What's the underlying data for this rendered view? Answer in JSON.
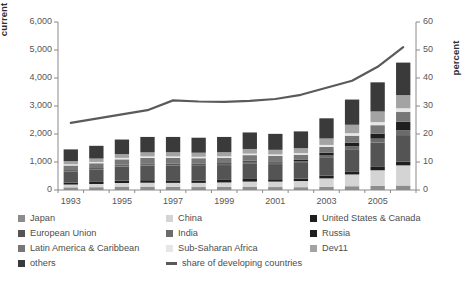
{
  "chart_data": {
    "type": "bar",
    "title": "",
    "subtitle": "",
    "stacked": true,
    "grid": false,
    "legend_position": "bottom",
    "xlabel": "",
    "ylabel": "current US$ (billions)",
    "y2label": "percent",
    "ylim": [
      0,
      6000
    ],
    "y2lim": [
      0,
      60
    ],
    "ytick_labels": [
      "6,000",
      "5,000",
      "4,000",
      "3,000",
      "2,000",
      "1,000",
      "0"
    ],
    "ytick_values": [
      6000,
      5000,
      4000,
      3000,
      2000,
      1000,
      0
    ],
    "y2tick_labels": [
      "60",
      "50",
      "40",
      "30",
      "20",
      "10",
      "0"
    ],
    "y2tick_values": [
      60,
      50,
      40,
      30,
      20,
      10,
      0
    ],
    "categories": [
      "1993",
      "1994",
      "1995",
      "1996",
      "1997",
      "1998",
      "1999",
      "2000",
      "2001",
      "2002",
      "2003",
      "2004",
      "2005",
      "2006"
    ],
    "xtick_labels": [
      "1993",
      "1995",
      "1997",
      "1999",
      "2001",
      "2003",
      "2005"
    ],
    "xtick_indices": [
      0,
      2,
      4,
      6,
      8,
      10,
      12
    ],
    "series": [
      {
        "name": "Japan",
        "color": "#8c8c8c",
        "values": [
          95,
          100,
          120,
          120,
          110,
          105,
          110,
          120,
          105,
          100,
          115,
          135,
          145,
          160
        ]
      },
      {
        "name": "China",
        "color": "#d4d4d4",
        "values": [
          100,
          115,
          130,
          140,
          145,
          150,
          160,
          180,
          195,
          220,
          300,
          420,
          560,
          720
        ]
      },
      {
        "name": "United States & Canada",
        "color": "#1f1f1f",
        "values": [
          70,
          75,
          85,
          90,
          90,
          85,
          90,
          95,
          85,
          85,
          95,
          110,
          120,
          130
        ]
      },
      {
        "name": "European Union",
        "color": "#545454",
        "values": [
          400,
          430,
          500,
          520,
          520,
          520,
          530,
          560,
          540,
          560,
          660,
          790,
          870,
          950
        ]
      },
      {
        "name": "India",
        "color": "#6b6b6b",
        "values": [
          30,
          35,
          40,
          40,
          40,
          45,
          50,
          55,
          55,
          60,
          80,
          110,
          140,
          175
        ]
      },
      {
        "name": "Russia",
        "color": "#1f1f1f",
        "values": [
          20,
          25,
          30,
          35,
          35,
          30,
          25,
          35,
          40,
          50,
          80,
          125,
          180,
          300
        ]
      },
      {
        "name": "Latin America & Caribbean",
        "color": "#777777",
        "values": [
          160,
          175,
          190,
          200,
          205,
          200,
          185,
          200,
          195,
          185,
          210,
          250,
          300,
          350
        ]
      },
      {
        "name": "Sub-Saharan Africa",
        "color": "#e6e6e6",
        "values": [
          45,
          48,
          52,
          55,
          55,
          52,
          50,
          55,
          55,
          58,
          70,
          90,
          110,
          135
        ]
      },
      {
        "name": "Dev11",
        "color": "#a3a3a3",
        "values": [
          110,
          120,
          135,
          145,
          150,
          145,
          150,
          165,
          165,
          175,
          230,
          300,
          380,
          470
        ]
      },
      {
        "name": "others",
        "color": "#3a3a3a",
        "values": [
          420,
          455,
          520,
          550,
          545,
          535,
          545,
          590,
          570,
          600,
          720,
          900,
          1040,
          1160
        ]
      }
    ],
    "line_series": {
      "name": "share of developing countries",
      "color": "#5a5a5a",
      "axis": "right",
      "unit": "percent",
      "values": [
        24.0,
        25.5,
        27.0,
        28.5,
        32.0,
        31.6,
        31.5,
        31.8,
        32.5,
        34.0,
        36.5,
        39.0,
        44.0,
        51.0
      ]
    }
  },
  "legend": {
    "column1": [
      {
        "label": "Japan",
        "color": "#8c8c8c",
        "type": "swatch"
      },
      {
        "label": "European Union",
        "color": "#545454",
        "type": "swatch"
      },
      {
        "label": "Latin America & Caribbean",
        "color": "#777777",
        "type": "swatch"
      },
      {
        "label": "others",
        "color": "#3a3a3a",
        "type": "swatch"
      }
    ],
    "column2": [
      {
        "label": "China",
        "color": "#d4d4d4",
        "type": "swatch"
      },
      {
        "label": "India",
        "color": "#6b6b6b",
        "type": "swatch"
      },
      {
        "label": "Sub-Saharan Africa",
        "color": "#e6e6e6",
        "type": "swatch"
      },
      {
        "label": "share of developing countries",
        "color": "#5a5a5a",
        "type": "line"
      }
    ],
    "column3": [
      {
        "label": "United States & Canada",
        "color": "#1f1f1f",
        "type": "swatch"
      },
      {
        "label": "Russia",
        "color": "#1f1f1f",
        "type": "swatch"
      },
      {
        "label": "Dev11",
        "color": "#a3a3a3",
        "type": "swatch"
      }
    ]
  },
  "colors": {
    "axis": "#8a8a8a",
    "tick_text": "#565656",
    "axis_title": "#2d2d2d",
    "background": "#ffffff",
    "line": "#5a5a5a"
  }
}
